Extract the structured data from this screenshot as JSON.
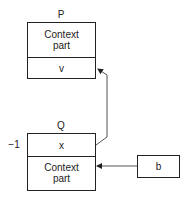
{
  "diagram": {
    "nodes": {
      "P": {
        "title": "P",
        "top_cell": "Context part",
        "bottom_cell": "v"
      },
      "Q": {
        "title": "Q",
        "side_label": "−1",
        "top_cell": "x",
        "bottom_cell": "Context part"
      },
      "b": {
        "label": "b"
      }
    },
    "edges": [
      {
        "from": "Q.x",
        "to": "P.v",
        "style": "arrow"
      },
      {
        "from": "b",
        "to": "Q.context",
        "style": "arrow"
      }
    ],
    "colors": {
      "stroke": "#222222",
      "edge": "#555555",
      "background": "#ffffff"
    }
  }
}
